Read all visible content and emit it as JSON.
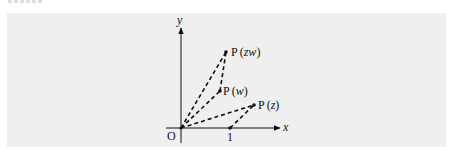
{
  "figure": {
    "background": "#efefef",
    "axes": {
      "x_label": "x",
      "y_label": "y",
      "origin_label": "O",
      "unit_tick_label": "1"
    },
    "points": [
      {
        "id": "zw",
        "label_prefix": "P",
        "label_arg": "zw",
        "x": 226,
        "y": 52
      },
      {
        "id": "w",
        "label_prefix": "P",
        "label_arg": "w",
        "x": 220,
        "y": 91
      },
      {
        "id": "z",
        "label_prefix": "P",
        "label_arg": "z",
        "x": 254,
        "y": 105
      }
    ],
    "dashed_segments": [
      [
        "O",
        "zw"
      ],
      [
        "O",
        "w"
      ],
      [
        "O",
        "z"
      ],
      [
        "w",
        "zw"
      ],
      [
        "one",
        "z"
      ]
    ],
    "colors": {
      "ink": "#111111"
    }
  }
}
